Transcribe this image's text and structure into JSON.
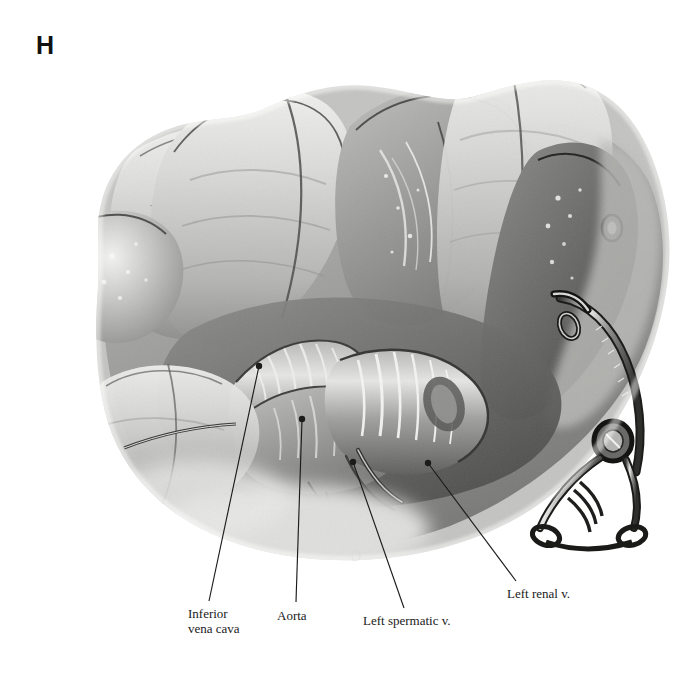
{
  "figure": {
    "panel_letter": "H",
    "type": "surgical anatomical illustration",
    "medium": "grayscale wash / halftone",
    "background_color": "#ffffff",
    "ink_color": "#1a1a1a"
  },
  "callouts": [
    {
      "id": "inferior-vena-cava",
      "label": "Inferior\nvena cava",
      "leader": {
        "x1": 259,
        "y1": 366,
        "x2": 209,
        "y2": 601
      }
    },
    {
      "id": "aorta",
      "label": "Aorta",
      "leader": {
        "x1": 302,
        "y1": 419,
        "x2": 296,
        "y2": 602
      }
    },
    {
      "id": "left-spermatic-vein",
      "label": "Left spermatic v.",
      "leader": {
        "x1": 353,
        "y1": 462,
        "x2": 404,
        "y2": 608
      }
    },
    {
      "id": "left-renal-vein",
      "label": "Left renal v.",
      "leader": {
        "x1": 428,
        "y1": 463,
        "x2": 516,
        "y2": 581
      }
    }
  ],
  "palette": {
    "tissue_light": "#d8d8d6",
    "tissue_mid": "#a9a9a7",
    "tissue_deep": "#7b7b79",
    "tissue_shadow": "#4e4e4c",
    "outline": "#2a2a28",
    "highlight": "#f2f2f0",
    "instrument_metal": "#8e8e8c"
  }
}
